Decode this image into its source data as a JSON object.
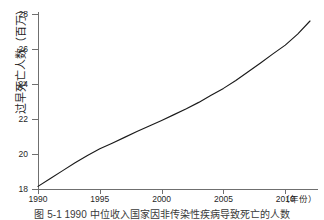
{
  "chart_data": {
    "type": "line",
    "title": "",
    "xlabel": "（年份）",
    "ylabel": "过早死亡人数（百万）",
    "xlim": [
      1990,
      2012
    ],
    "ylim": [
      18,
      28
    ],
    "grid": false,
    "legend": "none",
    "x_ticks": [
      1990,
      1995,
      2000,
      2005,
      2010
    ],
    "x_tick_labels": [
      "1990",
      "1995",
      "2000",
      "2005",
      "2010"
    ],
    "y_ticks": [
      18,
      20,
      22,
      24,
      26,
      28
    ],
    "y_tick_labels": [
      "18",
      "20",
      "22",
      "24",
      "26",
      "28"
    ],
    "series": [
      {
        "name": "过早死亡人数",
        "color": "#1a1a1a",
        "x": [
          1990,
          1991,
          1992,
          1993,
          1994,
          1995,
          1996,
          1997,
          1998,
          1999,
          2000,
          2001,
          2002,
          2003,
          2004,
          2005,
          2006,
          2007,
          2008,
          2009,
          2010,
          2011,
          2012
        ],
        "values": [
          18.15,
          18.6,
          19.05,
          19.5,
          19.92,
          20.3,
          20.62,
          20.95,
          21.28,
          21.6,
          21.92,
          22.25,
          22.58,
          22.95,
          23.35,
          23.75,
          24.2,
          24.7,
          25.2,
          25.72,
          26.22,
          26.85,
          27.6
        ]
      }
    ]
  },
  "caption": {
    "text": "图 5-1    1990 中位收入国家因非传染性疾病导致死亡的人数"
  },
  "colors": {
    "axis": "#6f6f6f",
    "line": "#1a1a1a",
    "text": "#1f1f1f",
    "background": "#ffffff"
  }
}
